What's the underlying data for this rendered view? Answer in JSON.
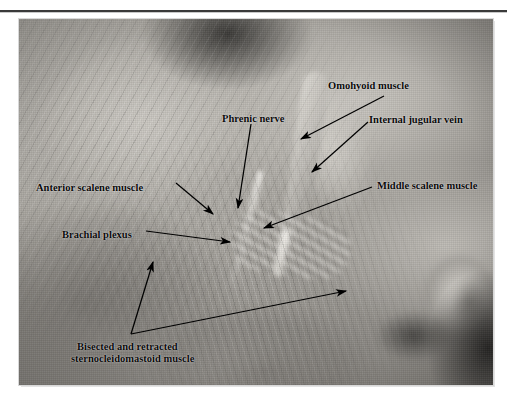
{
  "page": {
    "folio": "",
    "rule": true
  },
  "figure": {
    "kind": "anatomical-dissection-photograph",
    "palette": {
      "photo_light": "#c4c1bb",
      "photo_mid": "#9a9792",
      "photo_dark": "#5d5a56",
      "label_color": "#0a0a0a",
      "page_background": "#ffffff",
      "rule_color": "#3a3a3a"
    },
    "labels": [
      {
        "id": "omohyoid",
        "text": "Omohyoid muscle",
        "x": 328,
        "y": 80,
        "align": "left"
      },
      {
        "id": "internal-jugular",
        "text": "Internal jugular vein",
        "x": 369,
        "y": 114,
        "align": "left"
      },
      {
        "id": "phrenic",
        "text": "Phrenic nerve",
        "x": 222,
        "y": 113,
        "align": "left"
      },
      {
        "id": "anterior-scalene",
        "text": "Anterior scalene muscle",
        "x": 36,
        "y": 182,
        "align": "left"
      },
      {
        "id": "middle-scalene",
        "text": "Middle scalene muscle",
        "x": 377,
        "y": 180,
        "align": "left"
      },
      {
        "id": "brachial-plexus",
        "text": "Brachial plexus",
        "x": 62,
        "y": 229,
        "align": "left"
      },
      {
        "id": "sternocleidomastoid-1",
        "text": "Bisected and retracted",
        "x": 77,
        "y": 341,
        "align": "left"
      },
      {
        "id": "sternocleidomastoid-2",
        "text": "sternocleidomastoid muscle",
        "x": 71,
        "y": 353,
        "align": "left"
      }
    ],
    "leaders": [
      {
        "id": "leader-omohyoid",
        "from": [
          384,
          96
        ],
        "to": [
          300,
          139
        ]
      },
      {
        "id": "leader-internal-jugular",
        "from": [
          368,
          122
        ],
        "to": [
          311,
          172
        ]
      },
      {
        "id": "leader-phrenic",
        "from": [
          251,
          124
        ],
        "to": [
          238,
          208
        ]
      },
      {
        "id": "leader-anterior-scalene",
        "from": [
          176,
          183
        ],
        "to": [
          212,
          213
        ]
      },
      {
        "id": "leader-middle-scalene",
        "from": [
          372,
          187
        ],
        "to": [
          263,
          228
        ]
      },
      {
        "id": "leader-brachial-plexus",
        "from": [
          146,
          231
        ],
        "to": [
          229,
          241
        ]
      },
      {
        "id": "leader-scm-upper",
        "from": [
          131,
          334
        ],
        "to": [
          152,
          262
        ]
      },
      {
        "id": "leader-scm-lower",
        "from": [
          131,
          334
        ],
        "to": [
          345,
          290
        ]
      }
    ]
  }
}
